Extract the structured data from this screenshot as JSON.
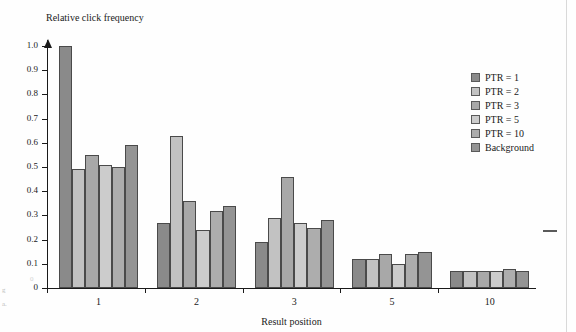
{
  "figure": {
    "margin_notes": [
      "g",
      "a."
    ],
    "margin_zero": "0"
  },
  "chart_data": {
    "type": "bar",
    "title": "",
    "xlabel": "Result position",
    "ylabel": "Relative click frequency",
    "categories": [
      "1",
      "2",
      "3",
      "5",
      "10"
    ],
    "ylim": [
      0,
      1.05
    ],
    "yticks": [
      "0",
      "0.1",
      "0.2",
      "0.3",
      "0.4",
      "0.5",
      "0.6",
      "0.7",
      "0.8",
      "0.9",
      "1.0"
    ],
    "ytick_values": [
      0,
      0.1,
      0.2,
      0.3,
      0.4,
      0.5,
      0.6,
      0.7,
      0.8,
      0.9,
      1.0
    ],
    "grid": false,
    "legend_position": "right",
    "series": [
      {
        "name": "PTR = 1",
        "color": "#8a8a8a",
        "values": [
          1.0,
          0.27,
          0.19,
          0.12,
          0.07
        ]
      },
      {
        "name": "PTR = 2",
        "color": "#c2c2c2",
        "values": [
          0.49,
          0.63,
          0.29,
          0.12,
          0.07
        ]
      },
      {
        "name": "PTR = 3",
        "color": "#a8a8a8",
        "values": [
          0.55,
          0.36,
          0.46,
          0.14,
          0.07
        ]
      },
      {
        "name": "PTR = 5",
        "color": "#cccccc",
        "values": [
          0.51,
          0.24,
          0.27,
          0.1,
          0.07
        ]
      },
      {
        "name": "PTR = 10",
        "color": "#adadad",
        "values": [
          0.5,
          0.32,
          0.25,
          0.14,
          0.08
        ]
      },
      {
        "name": "Background",
        "color": "#949494",
        "values": [
          0.59,
          0.34,
          0.28,
          0.15,
          0.07
        ]
      }
    ]
  }
}
